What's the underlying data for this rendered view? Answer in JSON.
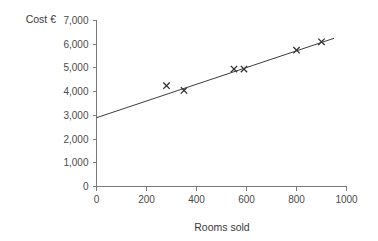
{
  "chart_data": {
    "type": "scatter",
    "title": "",
    "xlabel": "Rooms sold",
    "ylabel": "Cost €",
    "xlim": [
      0,
      1000
    ],
    "ylim": [
      0,
      7000
    ],
    "grid": false,
    "legend": "none",
    "x_ticks": [
      "0",
      "200",
      "400",
      "600",
      "800",
      "1000"
    ],
    "x_tick_values": [
      0,
      200,
      400,
      600,
      800,
      1000
    ],
    "y_ticks": [
      "0",
      "1,000",
      "2,000",
      "3,000",
      "4,000",
      "5,000",
      "6,000",
      "7,000"
    ],
    "y_tick_values": [
      0,
      1000,
      2000,
      3000,
      4000,
      5000,
      6000,
      7000
    ],
    "series": [
      {
        "name": "Observed costs",
        "marker": "x",
        "points": [
          {
            "x": 280,
            "y": 4250
          },
          {
            "x": 350,
            "y": 4050
          },
          {
            "x": 550,
            "y": 4950
          },
          {
            "x": 590,
            "y": 4950
          },
          {
            "x": 800,
            "y": 5750
          },
          {
            "x": 900,
            "y": 6100
          }
        ]
      },
      {
        "name": "Line of best fit",
        "marker": "line",
        "points": [
          {
            "x": 0,
            "y": 2900
          },
          {
            "x": 950,
            "y": 6250
          }
        ]
      }
    ],
    "axis_color": "#7a7a7a",
    "marker_color": "#2e2e2e",
    "line_color": "#3c3c3c"
  }
}
